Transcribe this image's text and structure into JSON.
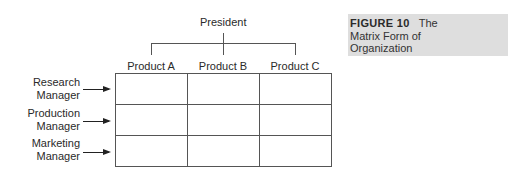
{
  "diagram": {
    "top_node": "President",
    "columns": [
      "Product A",
      "Product B",
      "Product C"
    ],
    "rows": [
      {
        "line1": "Research",
        "line2": "Manager"
      },
      {
        "line1": "Production",
        "line2": "Manager"
      },
      {
        "line1": "Marketing",
        "line2": "Manager"
      }
    ]
  },
  "caption": {
    "label": "FIGURE 10",
    "title_line1": "The",
    "title_line2": "Matrix Form of",
    "title_line3": "Organization"
  },
  "colors": {
    "caption_background": "#dedede",
    "lines": "#555555"
  }
}
